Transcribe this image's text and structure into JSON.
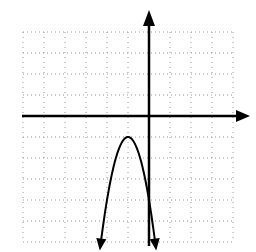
{
  "chart_data": {
    "type": "line",
    "title": "",
    "xlabel": "",
    "ylabel": "",
    "function": "y = -3(x+1)^2 - 1",
    "vertex": [
      -1,
      -1
    ],
    "xlim": [
      -6,
      4
    ],
    "ylim": [
      -6,
      4
    ],
    "grid": true,
    "grid_style": "dotted",
    "grid_step": 1,
    "x": [
      -2.3,
      -2.0,
      -1.5,
      -1.0,
      -0.5,
      0.0,
      0.3
    ],
    "values": [
      -6.07,
      -4.0,
      -1.75,
      -1.0,
      -1.75,
      -4.0,
      -6.07
    ],
    "series": [
      {
        "name": "parabola",
        "color": "#000000",
        "x": [
          -2.3,
          -2.0,
          -1.5,
          -1.0,
          -0.5,
          0.0,
          0.3
        ],
        "values": [
          -6.07,
          -4.0,
          -1.75,
          -1.0,
          -1.75,
          -4.0,
          -6.07
        ]
      }
    ],
    "axes": {
      "x_arrow": true,
      "y_arrow": true,
      "color": "#000000"
    }
  },
  "layout": {
    "origin_px": [
      149,
      116
    ],
    "unit_px": 21,
    "grid_color": "#9a9a9a"
  }
}
